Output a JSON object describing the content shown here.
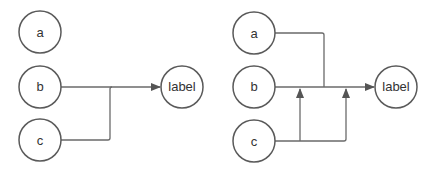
{
  "colors": {
    "stroke": "#5a5a5a",
    "edge": "#6a6a6a",
    "text": "#333333",
    "background": "#ffffff"
  },
  "left_diagram": {
    "nodes": [
      {
        "id": "a",
        "label": "a"
      },
      {
        "id": "b",
        "label": "b"
      },
      {
        "id": "c",
        "label": "c"
      },
      {
        "id": "label",
        "label": "label"
      }
    ],
    "edges": [
      {
        "from": "b",
        "to": "label"
      },
      {
        "from": "c",
        "to": "label",
        "merge_into": "b-label"
      }
    ]
  },
  "right_diagram": {
    "nodes": [
      {
        "id": "a",
        "label": "a"
      },
      {
        "id": "b",
        "label": "b"
      },
      {
        "id": "c",
        "label": "c"
      },
      {
        "id": "label",
        "label": "label"
      }
    ],
    "edges": [
      {
        "from": "b",
        "to": "label"
      },
      {
        "from": "a",
        "to": "label",
        "merge_into": "b-label"
      },
      {
        "from": "c",
        "to": "b-label",
        "count": 2
      }
    ]
  }
}
